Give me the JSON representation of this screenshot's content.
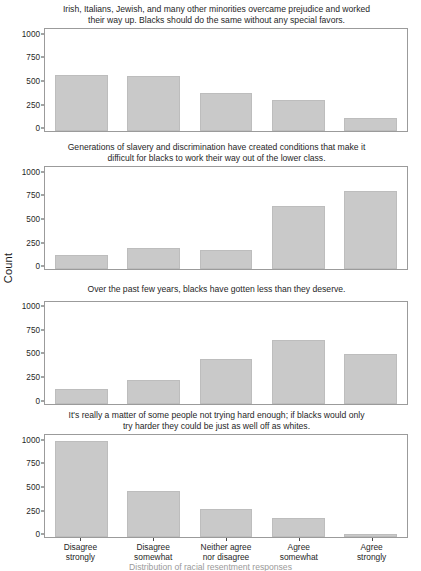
{
  "chart_data": {
    "type": "bar",
    "title": "",
    "xlabel": "",
    "ylabel": "Count",
    "ylim": [
      0,
      1100
    ],
    "yticks": [
      0,
      250,
      500,
      750,
      1000
    ],
    "ytick_labels": [
      "0",
      "250",
      "500",
      "750",
      "1000"
    ],
    "grid": false,
    "legend": "none",
    "categories": [
      "Disagree\nstrongly",
      "Disagree\nsomewhat",
      "Neither agree\nnor disagree",
      "Agree\nsomewhat",
      "Agree\nstrongly"
    ],
    "facets": [
      {
        "title": "Irish, Italians, Jewish, and many other minorities overcame prejudice and worked\ntheir way up. Blacks should do the same without any special favors.",
        "values": [
          600,
          595,
          405,
          335,
          145
        ]
      },
      {
        "title": "Generations of slavery and discrimination have created conditions that make it\ndifficult for blacks to work their way out of the lower class.",
        "values": [
          155,
          225,
          205,
          675,
          840
        ]
      },
      {
        "title": "Over the past few years, blacks have gotten less than they deserve.",
        "values": [
          155,
          255,
          475,
          680,
          530
        ]
      },
      {
        "title": "It's really a matter of some people not trying hard enough; if blacks would only\ntry harder they could be just as well off as whites.",
        "values": [
          1040,
          495,
          305,
          205,
          35
        ]
      }
    ],
    "colors": {
      "bar_fill": "#c9c9c9",
      "bar_stroke": "#bdbdbd",
      "panel_border": "#9b9b9b",
      "text": "#1f1f1f",
      "background": "#ffffff"
    }
  },
  "caption": "Distribution of racial resentment responses"
}
